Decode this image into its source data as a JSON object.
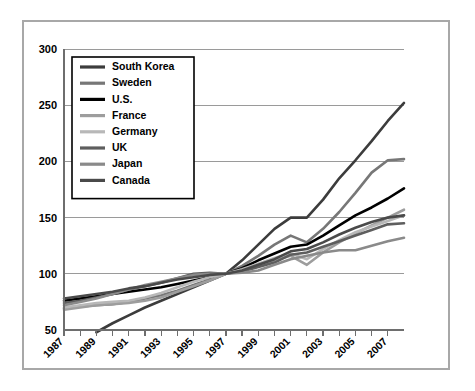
{
  "chart_data": {
    "type": "line",
    "title": "",
    "subtitle": "",
    "xlabel": "",
    "ylabel": "",
    "xlim": [
      1987,
      2008
    ],
    "ylim": [
      50,
      300
    ],
    "yticks": [
      50,
      100,
      150,
      200,
      250,
      300
    ],
    "ytick_labels": [
      "50",
      "100",
      "150",
      "200",
      "250",
      "300"
    ],
    "x": [
      1987,
      1988,
      1989,
      1990,
      1991,
      1992,
      1993,
      1994,
      1995,
      1996,
      1997,
      1998,
      1999,
      2000,
      2001,
      2002,
      2003,
      2004,
      2005,
      2006,
      2007,
      2008
    ],
    "xtick_labels": [
      "1987",
      "1989",
      "1991",
      "1993",
      "1995",
      "1997",
      "1999",
      "2001",
      "2003",
      "2005",
      "2007"
    ],
    "xtick_years": [
      1987,
      1989,
      1991,
      1993,
      1995,
      1997,
      1999,
      2001,
      2003,
      2005,
      2007
    ],
    "grid": true,
    "grid_axis": "y",
    "legend_position": "upper-left",
    "series": [
      {
        "name": "South Korea",
        "color": "#3c3c3c",
        "values": [
          null,
          null,
          48,
          56,
          63,
          70,
          76,
          82,
          88,
          94,
          100,
          112,
          126,
          140,
          150,
          150,
          166,
          185,
          201,
          218,
          236,
          252
        ]
      },
      {
        "name": "Sweden",
        "color": "#777777",
        "values": [
          69,
          71,
          72,
          73,
          75,
          78,
          81,
          85,
          90,
          95,
          100,
          107,
          116,
          126,
          134,
          128,
          140,
          155,
          172,
          190,
          201,
          202
        ]
      },
      {
        "name": "U.S.",
        "color": "#000000",
        "values": [
          76,
          78,
          80,
          82,
          84,
          86,
          88,
          91,
          94,
          97,
          100,
          105,
          112,
          118,
          124,
          126,
          134,
          143,
          152,
          159,
          167,
          176
        ]
      },
      {
        "name": "France",
        "color": "#9d9d9d",
        "values": [
          68,
          70,
          72,
          73,
          74,
          76,
          79,
          84,
          89,
          94,
          100,
          103,
          107,
          112,
          116,
          108,
          119,
          128,
          136,
          143,
          150,
          157
        ]
      },
      {
        "name": "Germany",
        "color": "#b8b8b8",
        "values": [
          70,
          72,
          74,
          75,
          76,
          79,
          83,
          88,
          93,
          97,
          100,
          104,
          109,
          114,
          118,
          113,
          122,
          130,
          137,
          142,
          147,
          152
        ]
      },
      {
        "name": "UK",
        "color": "#5e5e5e",
        "values": [
          74,
          76,
          79,
          82,
          86,
          89,
          92,
          96,
          100,
          101,
          100,
          102,
          106,
          110,
          117,
          119,
          124,
          129,
          134,
          139,
          144,
          145
        ]
      },
      {
        "name": "Japan",
        "color": "#8a8a8a",
        "values": [
          72,
          75,
          78,
          82,
          86,
          90,
          93,
          96,
          99,
          100,
          100,
          101,
          103,
          108,
          113,
          116,
          119,
          121,
          121,
          125,
          129,
          132
        ]
      },
      {
        "name": "Canada",
        "color": "#4a4a4a",
        "values": [
          78,
          80,
          82,
          84,
          87,
          89,
          92,
          95,
          97,
          99,
          100,
          103,
          108,
          113,
          120,
          122,
          128,
          135,
          141,
          146,
          150,
          152
        ]
      }
    ]
  }
}
